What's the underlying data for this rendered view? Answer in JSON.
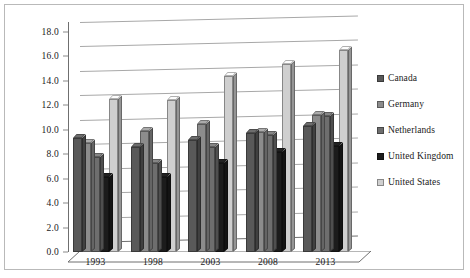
{
  "chart_data": {
    "type": "bar",
    "title": "",
    "xlabel": "",
    "ylabel": "",
    "ylim": [
      0.0,
      18.0
    ],
    "ytick_step": 2.0,
    "ytick_labels": [
      "0.0",
      "2.0",
      "4.0",
      "6.0",
      "8.0",
      "10.0",
      "12.0",
      "14.0",
      "16.0",
      "18.0"
    ],
    "grid": true,
    "legend_position": "right",
    "style": "3d-clustered-column",
    "categories": [
      "1993",
      "1998",
      "2003",
      "2008",
      "2013"
    ],
    "series": [
      {
        "name": "Canada",
        "color": "#595959",
        "values": [
          9.3,
          8.6,
          9.2,
          9.7,
          10.3
        ]
      },
      {
        "name": "Germany",
        "color": "#8c8c8c",
        "values": [
          8.9,
          9.9,
          10.5,
          9.8,
          11.2
        ]
      },
      {
        "name": "Netherlands",
        "color": "#6e6e6e",
        "values": [
          7.8,
          7.3,
          8.6,
          9.6,
          11.1
        ]
      },
      {
        "name": "United Kingdom",
        "color": "#1c1c1c",
        "values": [
          6.1,
          6.1,
          7.3,
          8.2,
          8.7
        ]
      },
      {
        "name": "United States",
        "color": "#cfcfcf",
        "values": [
          12.5,
          12.4,
          14.4,
          15.4,
          16.5
        ]
      }
    ]
  },
  "legend": {
    "items": [
      {
        "label": "Canada"
      },
      {
        "label": "Germany"
      },
      {
        "label": "Netherlands"
      },
      {
        "label": "United Kingdom"
      },
      {
        "label": "United States"
      }
    ]
  },
  "caption": {
    "artifact_text": ""
  }
}
